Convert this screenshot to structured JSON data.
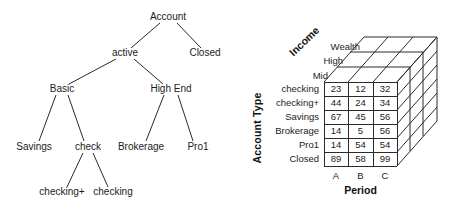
{
  "ink_color": "#1c1c1c",
  "line_color": "#2a2a2a",
  "background_color": "#ffffff",
  "tree": {
    "nodes": {
      "account": {
        "label": "Account"
      },
      "active": {
        "label": "active"
      },
      "closed": {
        "label": "Closed"
      },
      "basic": {
        "label": "Basic"
      },
      "high_end": {
        "label": "High End"
      },
      "savings": {
        "label": "Savings"
      },
      "check": {
        "label": "check"
      },
      "brokerage": {
        "label": "Brokerage"
      },
      "pro1": {
        "label": "Pro1"
      },
      "checking_plus": {
        "label": "checking+"
      },
      "checking": {
        "label": "checking"
      }
    },
    "edges": [
      {
        "from": "account",
        "to": "active"
      },
      {
        "from": "account",
        "to": "closed"
      },
      {
        "from": "active",
        "to": "basic"
      },
      {
        "from": "active",
        "to": "high_end"
      },
      {
        "from": "basic",
        "to": "savings"
      },
      {
        "from": "basic",
        "to": "check"
      },
      {
        "from": "check",
        "to": "checking_plus"
      },
      {
        "from": "check",
        "to": "checking"
      },
      {
        "from": "high_end",
        "to": "brokerage"
      },
      {
        "from": "high_end",
        "to": "pro1"
      }
    ]
  },
  "cube": {
    "axes": {
      "depth_axis": "Income",
      "row_axis": "Account Type",
      "col_axis": "Period"
    },
    "layer_labels": [
      "Wealth",
      "High",
      "Mid"
    ],
    "row_labels": [
      "checking",
      "checking+",
      "Savings",
      "Brokerage",
      "Pro1",
      "Closed"
    ],
    "col_labels": [
      "A",
      "B",
      "C"
    ],
    "values": [
      [
        23,
        12,
        32
      ],
      [
        44,
        24,
        34
      ],
      [
        67,
        45,
        56
      ],
      [
        14,
        5,
        56
      ],
      [
        14,
        54,
        54
      ],
      [
        89,
        58,
        99
      ]
    ]
  }
}
